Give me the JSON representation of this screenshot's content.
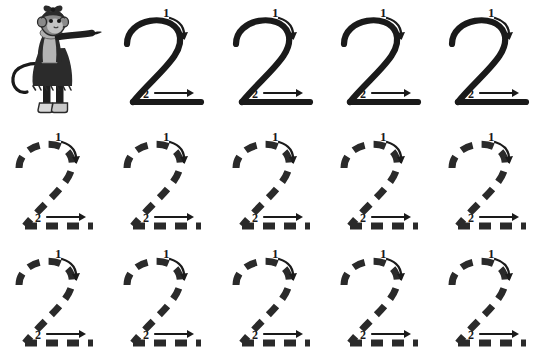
{
  "worksheet": {
    "title_remnant": "",
    "digit": "2",
    "stroke_color": "#1a1a1a",
    "background_color": "#ffffff",
    "stroke_labels": {
      "first": "1",
      "second": "2"
    },
    "mascot": {
      "name": "monkey-girl-pointing",
      "colors": {
        "fur": "#8a8a8a",
        "fur_light": "#b9b9b9",
        "dress": "#2b2b2b",
        "shirt": "#b0b0b0",
        "boots": "#d8d8d8",
        "outline": "#1a1a1a",
        "bow": "#2b2b2b"
      }
    },
    "rows": [
      {
        "name": "row-solid",
        "style": "solid",
        "has_mascot": true,
        "cells": [
          {
            "label": "2",
            "style": "solid"
          },
          {
            "label": "2",
            "style": "solid"
          },
          {
            "label": "2",
            "style": "solid"
          },
          {
            "label": "2",
            "style": "solid"
          }
        ]
      },
      {
        "name": "row-dashed-1",
        "style": "dashed",
        "has_mascot": false,
        "cells": [
          {
            "label": "2",
            "style": "dashed"
          },
          {
            "label": "2",
            "style": "dashed"
          },
          {
            "label": "2",
            "style": "dashed"
          },
          {
            "label": "2",
            "style": "dashed"
          },
          {
            "label": "2",
            "style": "dashed"
          }
        ]
      },
      {
        "name": "row-dashed-2",
        "style": "dashed",
        "has_mascot": false,
        "cells": [
          {
            "label": "2",
            "style": "dashed"
          },
          {
            "label": "2",
            "style": "dashed"
          },
          {
            "label": "2",
            "style": "dashed"
          },
          {
            "label": "2",
            "style": "dashed"
          },
          {
            "label": "2",
            "style": "dashed"
          }
        ]
      }
    ],
    "column_left_positions": [
      5,
      113,
      222,
      330,
      438
    ],
    "column_pitch": 108
  }
}
